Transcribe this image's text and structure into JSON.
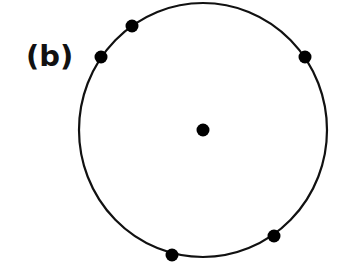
{
  "figure": {
    "label": "(b)",
    "circle": {
      "cx": 203,
      "cy": 130,
      "rx": 124,
      "ry": 127,
      "stroke": "#111111"
    },
    "center_point": {
      "x": 203,
      "y": 130
    },
    "points_on_circle": [
      {
        "x": 132,
        "y": 26
      },
      {
        "x": 101,
        "y": 57
      },
      {
        "x": 305,
        "y": 57
      },
      {
        "x": 274,
        "y": 236
      },
      {
        "x": 172,
        "y": 255
      }
    ],
    "dot_color": "#000000"
  }
}
